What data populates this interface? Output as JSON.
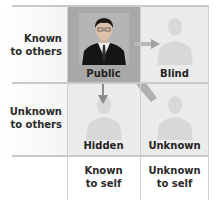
{
  "rows": [
    {
      "label_line1": "Known",
      "label_line2": "to others"
    },
    {
      "label_line1": "Unknown",
      "label_line2": "to others"
    }
  ],
  "columns": [
    {
      "label_line1": "Known",
      "label_line2": "to self"
    },
    {
      "label_line1": "Unknown",
      "label_line2": "to self"
    }
  ],
  "quadrants": {
    "public": {
      "label": "Public",
      "image": "person-photo"
    },
    "blind": {
      "label": "Blind",
      "image": "faded-person-silhouette"
    },
    "hidden": {
      "label": "Hidden",
      "image": "faded-person-silhouette"
    },
    "unknown": {
      "label": "Unknown",
      "image": "faded-person-silhouette"
    }
  },
  "arrows": [
    {
      "from": "public",
      "to": "blind",
      "direction": "right"
    },
    {
      "from": "public",
      "to": "hidden",
      "direction": "down"
    },
    {
      "from": "public",
      "to": "unknown",
      "direction": "diagonal"
    }
  ],
  "colors": {
    "public_bg": "#a9a9a9",
    "quadrant_bg": "#ececec",
    "grid_line": "#c9c9c9",
    "label_text": "#2a2a2a",
    "suit": "#141414"
  }
}
